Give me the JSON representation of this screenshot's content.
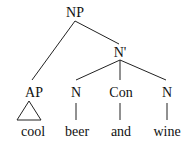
{
  "tree": {
    "root": {
      "label": "NP"
    },
    "nbar": {
      "label": "N'"
    },
    "ap": {
      "label": "AP",
      "leaf": "cool"
    },
    "n1": {
      "label": "N",
      "leaf": "beer"
    },
    "con": {
      "label": "Con",
      "leaf": "and"
    },
    "n2": {
      "label": "N",
      "leaf": "wine"
    }
  },
  "colors": {
    "line": "#222222",
    "text": "#111111",
    "background": "#ffffff"
  }
}
